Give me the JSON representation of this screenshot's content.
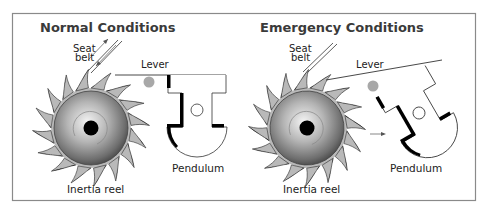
{
  "diagram": {
    "colors": {
      "frame": "#8a8a8a",
      "tooth_fill": "#b9b9b9",
      "hub_dark": "#000000",
      "lever_ball": "#a8a8a8",
      "line": "#333333"
    },
    "panels": [
      {
        "title": "Normal Conditions",
        "labels": {
          "seat_belt_line1": "Seat",
          "seat_belt_line2": "belt",
          "lever": "Lever",
          "pendulum": "Pendulum",
          "reel": "Inertia reel"
        },
        "state": "upright pendulum, lever free, belt moving (arrows)"
      },
      {
        "title": "Emergency Conditions",
        "labels": {
          "seat_belt_line1": "Seat",
          "seat_belt_line2": "belt",
          "lever": "Lever",
          "pendulum": "Pendulum",
          "reel": "Inertia reel"
        },
        "state": "pendulum swung, lever engages reel teeth, arrow shows motion"
      }
    ]
  }
}
